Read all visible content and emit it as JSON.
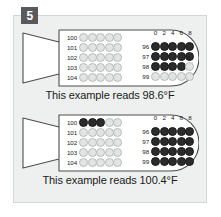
{
  "step": {
    "number": "5"
  },
  "colors": {
    "panel_bg": "#eef0f0",
    "panel_border": "#d2d6d7",
    "badge_bg": "#59595b",
    "dot_filled": "#2b2b2d",
    "dot_open": "#e2e3e3",
    "outline": "#4d4d4f",
    "text": "#1a1a1a"
  },
  "unit_symbol": "°F",
  "column_headers": [
    "0",
    "2",
    "4",
    "6",
    "8"
  ],
  "examples": [
    {
      "id": "example-1",
      "caption": "This example reads 98.6°F",
      "reading": "98.6",
      "unit": "°F",
      "left_grid": {
        "row_labels": [
          "100",
          "101",
          "102",
          "103",
          "104"
        ],
        "rows": [
          [
            0,
            0,
            0,
            0,
            0
          ],
          [
            0,
            0,
            0,
            0,
            0
          ],
          [
            0,
            0,
            0,
            0,
            0
          ],
          [
            0,
            0,
            0,
            0,
            0
          ],
          [
            0,
            0,
            0,
            0,
            0
          ]
        ]
      },
      "right_grid": {
        "row_labels": [
          "96",
          "97",
          "98",
          "99"
        ],
        "rows": [
          [
            1,
            1,
            1,
            1,
            1
          ],
          [
            1,
            1,
            1,
            1,
            1
          ],
          [
            1,
            1,
            1,
            1,
            0
          ],
          [
            0,
            0,
            0,
            0,
            0
          ]
        ]
      }
    },
    {
      "id": "example-2",
      "caption": "This example reads 100.4°F",
      "reading": "100.4",
      "unit": "°F",
      "left_grid": {
        "row_labels": [
          "100",
          "101",
          "102",
          "103",
          "104"
        ],
        "rows": [
          [
            1,
            1,
            1,
            0,
            0
          ],
          [
            0,
            0,
            0,
            0,
            0
          ],
          [
            0,
            0,
            0,
            0,
            0
          ],
          [
            0,
            0,
            0,
            0,
            0
          ],
          [
            0,
            0,
            0,
            0,
            0
          ]
        ]
      },
      "right_grid": {
        "row_labels": [
          "96",
          "97",
          "98",
          "99"
        ],
        "rows": [
          [
            1,
            1,
            1,
            1,
            1
          ],
          [
            1,
            1,
            1,
            1,
            1
          ],
          [
            1,
            1,
            1,
            1,
            1
          ],
          [
            1,
            1,
            1,
            1,
            1
          ]
        ]
      }
    }
  ]
}
